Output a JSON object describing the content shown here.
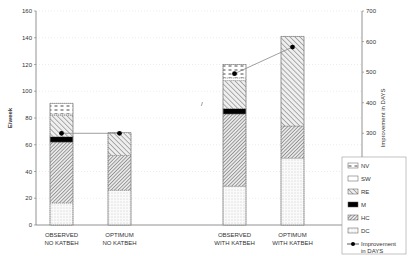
{
  "chart_data": {
    "type": "bar",
    "stacked": true,
    "title": "",
    "xlabel": "",
    "ylabel": "E/week",
    "y2label": "Improvement in DAYS",
    "ylim": [
      0,
      160
    ],
    "y2lim": [
      0,
      700
    ],
    "yticks": [
      0,
      20,
      40,
      60,
      80,
      100,
      120,
      140,
      160
    ],
    "y2ticks": [
      0,
      100,
      200,
      300,
      400,
      500,
      600,
      700
    ],
    "grid": true,
    "legend_position": "right-bottom",
    "categories": [
      "OBSERVED\nNO KATBEH",
      "OPTIMUM\nNO KATBEH",
      "OBSERVED\nWITH KATBEH",
      "OPTIMUM\nWITH KATBEH"
    ],
    "category_lines": [
      [
        "OBSERVED",
        "NO KATBEH"
      ],
      [
        "OPTIMUM",
        "NO KATBEH"
      ],
      [
        "OBSERVED",
        "WITH KATBEH"
      ],
      [
        "OPTIMUM",
        "WITH KATBEH"
      ]
    ],
    "series": [
      {
        "name": "DC",
        "values": [
          16.5,
          26,
          29,
          50
        ],
        "pattern": "dots"
      },
      {
        "name": "HC",
        "values": [
          45.5,
          26,
          54,
          24
        ],
        "pattern": "hatch-dense"
      },
      {
        "name": "M",
        "values": [
          4,
          0,
          4,
          0
        ],
        "pattern": "solid-black"
      },
      {
        "name": "RE",
        "values": [
          16,
          17,
          21,
          67
        ],
        "pattern": "hatch"
      },
      {
        "name": "SW",
        "values": [
          1,
          0,
          2,
          0
        ],
        "pattern": "white"
      },
      {
        "name": "NV",
        "values": [
          8,
          0,
          10,
          0
        ],
        "pattern": "dashes"
      }
    ],
    "line_series": {
      "name": "Improvement in DAYS",
      "axis": "right",
      "values": [
        300,
        300,
        495,
        582
      ]
    }
  },
  "legend": {
    "items": [
      "NV",
      "SW",
      "RE",
      "M",
      "HC",
      "DC"
    ],
    "line_label_1": "Improvement",
    "line_label_2": "in DAYS"
  },
  "axes": {
    "left_title": "E/week",
    "right_title": "Improvement in DAYS"
  }
}
